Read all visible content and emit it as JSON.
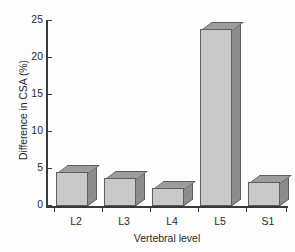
{
  "chart_data": {
    "type": "bar",
    "title": "",
    "subtitle": "",
    "xlabel": "Vertebral level",
    "ylabel": "Difference in CSA (%)",
    "categories": [
      "L2",
      "L3",
      "L4",
      "L5",
      "S1"
    ],
    "values": [
      4.6,
      3.8,
      2.4,
      23.8,
      3.2
    ],
    "series": [
      {
        "name": "Difference in CSA",
        "values": [
          4.6,
          3.8,
          2.4,
          23.8,
          3.2
        ]
      }
    ],
    "ylim": [
      0,
      25
    ],
    "yticks": [
      0,
      5,
      10,
      15,
      20,
      25
    ],
    "ytick_labels": [
      "0",
      "5",
      "10",
      "15",
      "20",
      "25"
    ],
    "xtick_labels": [
      "L2",
      "L3",
      "L4",
      "L5",
      "S1"
    ],
    "grid": false,
    "legend": null,
    "legend_position": "none",
    "style": "3d-bar",
    "colors": {
      "bar_front": "#c9c9c9",
      "bar_side": "#8c8c8c",
      "bar_top": "#9d9d9d",
      "bar_edge": "#5e5e5e",
      "axis": "#3a3a3a",
      "text": "#2b2b2b",
      "background": "#fdfdfd"
    }
  }
}
